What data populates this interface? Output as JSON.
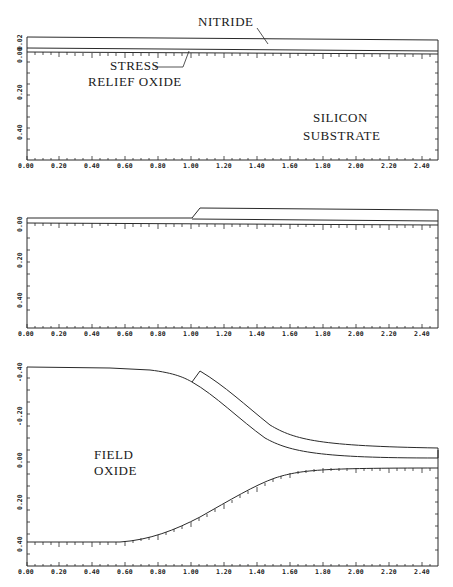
{
  "panels": [
    {
      "id": "panel-1",
      "labels": {
        "nitride": "NITRIDE",
        "stress1": "STRESS",
        "stress2": "RELIEF OXIDE",
        "silicon1": "SILICON",
        "silicon2": "SUBSTRATE"
      },
      "x_ticks": [
        "0.00",
        "0.20",
        "0.40",
        "0.60",
        "0.80",
        "1.00",
        "1.20",
        "1.40",
        "1.60",
        "1.80",
        "2.00",
        "2.20",
        "2.40"
      ],
      "y_ticks": [
        "0.02",
        "0.00",
        "0.20",
        "0.40"
      ]
    },
    {
      "id": "panel-2",
      "labels": {},
      "x_ticks": [
        "0.00",
        "0.20",
        "0.40",
        "0.60",
        "0.80",
        "1.00",
        "1.20",
        "1.40",
        "1.60",
        "1.80",
        "2.00",
        "2.20",
        "2.40"
      ],
      "y_ticks": [
        "0.00",
        "0.20",
        "0.40"
      ]
    },
    {
      "id": "panel-3",
      "labels": {
        "field1": "FIELD",
        "field2": "OXIDE"
      },
      "x_ticks": [
        "0.00",
        "0.20",
        "0.40",
        "0.60",
        "0.80",
        "1.00",
        "1.20",
        "1.40",
        "1.60",
        "1.80",
        "2.00",
        "2.20",
        "2.40"
      ],
      "y_ticks": [
        "-0.40",
        "-0.20",
        "0.00",
        "0.20",
        "0.40"
      ]
    }
  ],
  "colors": {
    "ink": "#2a2a2a",
    "paper": "#ffffff"
  }
}
